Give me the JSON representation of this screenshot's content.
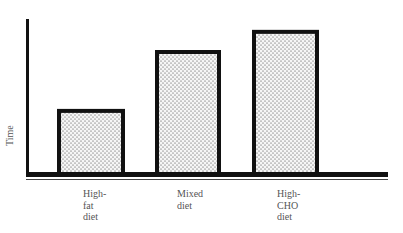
{
  "chart_data": {
    "type": "bar",
    "title": "",
    "xlabel": "",
    "ylabel": "Time",
    "categories": [
      "High-fat diet",
      "Mixed diet",
      "High-CHO diet"
    ],
    "category_labels": [
      "High-\nfat\ndiet",
      "Mixed\ndiet",
      "High-\nCHO\ndiet"
    ],
    "values": [
      0.42,
      0.8,
      0.93
    ],
    "ylim": [
      0,
      1
    ],
    "grid": false,
    "legend": null,
    "bar_fill": "stippled",
    "colors": {
      "outline": "#111111",
      "fill_bg": "#f4f4f4",
      "dots": "#333333",
      "text": "#555555"
    }
  }
}
